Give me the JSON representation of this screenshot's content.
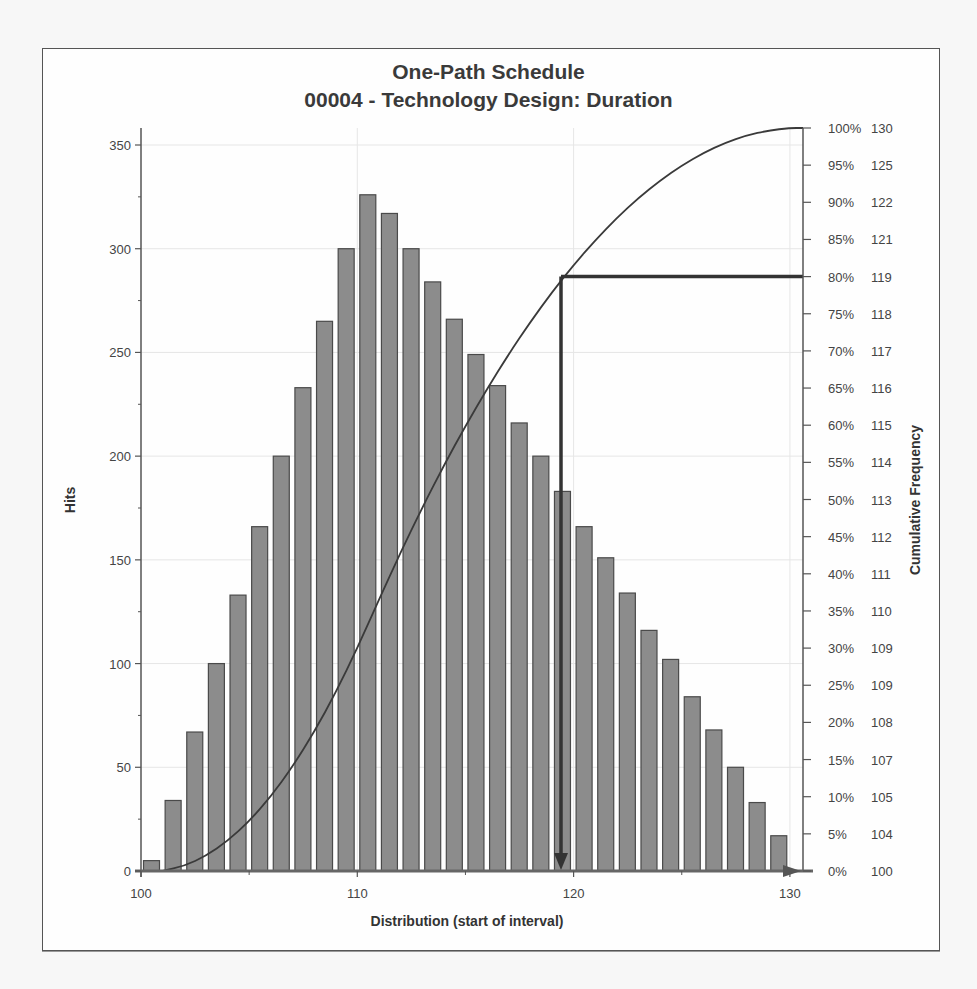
{
  "chart": {
    "title_line1": "One-Path Schedule",
    "title_line2": "00004 - Technology Design: Duration",
    "xlabel": "Distribution (start of interval)",
    "ylabel_left": "Hits",
    "ylabel_right": "Cumulative Frequency",
    "x_ticks": [
      "100",
      "110",
      "120",
      "130"
    ],
    "y_ticks": [
      "0",
      "50",
      "100",
      "150",
      "200",
      "250",
      "300",
      "350"
    ],
    "right_ticks": [
      {
        "pct": "0%",
        "val": "100"
      },
      {
        "pct": "5%",
        "val": "104"
      },
      {
        "pct": "10%",
        "val": "105"
      },
      {
        "pct": "15%",
        "val": "107"
      },
      {
        "pct": "20%",
        "val": "108"
      },
      {
        "pct": "25%",
        "val": "109"
      },
      {
        "pct": "30%",
        "val": "109"
      },
      {
        "pct": "35%",
        "val": "110"
      },
      {
        "pct": "40%",
        "val": "111"
      },
      {
        "pct": "45%",
        "val": "112"
      },
      {
        "pct": "50%",
        "val": "113"
      },
      {
        "pct": "55%",
        "val": "114"
      },
      {
        "pct": "60%",
        "val": "115"
      },
      {
        "pct": "65%",
        "val": "116"
      },
      {
        "pct": "70%",
        "val": "117"
      },
      {
        "pct": "75%",
        "val": "118"
      },
      {
        "pct": "80%",
        "val": "119"
      },
      {
        "pct": "85%",
        "val": "121"
      },
      {
        "pct": "90%",
        "val": "122"
      },
      {
        "pct": "95%",
        "val": "125"
      },
      {
        "pct": "100%",
        "val": "130"
      }
    ],
    "colors": {
      "bar_fill": "#8c8c8c",
      "bar_stroke": "#4a4a4a",
      "curve": "#3a3a3a",
      "marker": "#333333",
      "grid": "#e6e6e6",
      "axis": "#555555"
    }
  },
  "chart_data": {
    "type": "bar",
    "xlabel": "Distribution (start of interval)",
    "ylabel": "Hits",
    "y2label": "Cumulative Frequency",
    "ylim": [
      0,
      350
    ],
    "xlim": [
      100,
      131
    ],
    "grid": true,
    "categories": [
      100,
      101,
      102,
      103,
      104,
      105,
      106,
      107,
      108,
      109,
      110,
      111,
      112,
      113,
      114,
      115,
      116,
      117,
      118,
      119,
      120,
      121,
      122,
      123,
      124,
      125,
      126,
      127,
      128,
      129
    ],
    "series": [
      {
        "name": "Hits",
        "values": [
          5,
          34,
          67,
          100,
          133,
          166,
          200,
          233,
          265,
          300,
          326,
          317,
          300,
          284,
          266,
          249,
          234,
          216,
          200,
          183,
          166,
          151,
          134,
          116,
          102,
          84,
          68,
          50,
          33,
          17
        ]
      },
      {
        "name": "Cumulative Frequency",
        "type": "line",
        "unit": "%"
      }
    ],
    "annotations": [
      {
        "type": "percentile-marker",
        "percentile": "80%",
        "value": 119
      }
    ],
    "right_axis": {
      "percent": [
        0,
        5,
        10,
        15,
        20,
        25,
        30,
        35,
        40,
        45,
        50,
        55,
        60,
        65,
        70,
        75,
        80,
        85,
        90,
        95,
        100
      ],
      "duration": [
        100,
        104,
        105,
        107,
        108,
        109,
        109,
        110,
        111,
        112,
        113,
        114,
        115,
        116,
        117,
        118,
        119,
        121,
        122,
        125,
        130
      ]
    }
  }
}
